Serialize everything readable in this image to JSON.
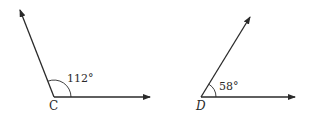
{
  "diagram": {
    "type": "angles",
    "colors": {
      "stroke": "#2a2a2a",
      "background": "#ffffff"
    },
    "angles": [
      {
        "vertex_label": "C",
        "measure_label": "112°",
        "measure": 112,
        "vertex": [
          54,
          97
        ],
        "ray_tips": [
          [
            150,
            97
          ],
          [
            20,
            10
          ]
        ]
      },
      {
        "vertex_label": "D",
        "measure_label": "58°",
        "measure": 58,
        "vertex": [
          201,
          97
        ],
        "ray_tips": [
          [
            295,
            97
          ],
          [
            250,
            17
          ]
        ]
      }
    ]
  }
}
